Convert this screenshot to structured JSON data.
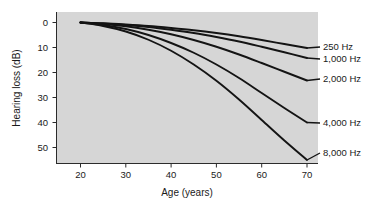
{
  "chart_data": {
    "type": "line",
    "title": "",
    "xlabel": "Age (years)",
    "ylabel": "Hearing loss (dB)",
    "x": [
      20,
      25,
      30,
      35,
      40,
      45,
      50,
      55,
      60,
      65,
      70
    ],
    "xlim": [
      18,
      72
    ],
    "ylim": [
      0,
      58
    ],
    "y_inverted": true,
    "xticks": [
      20,
      30,
      40,
      50,
      60,
      70
    ],
    "xticklabels": [
      "20",
      "30",
      "40",
      "50",
      "60",
      "70"
    ],
    "yticks": [
      0,
      10,
      20,
      30,
      40,
      50
    ],
    "yticklabels": [
      "0",
      "10",
      "20",
      "30",
      "40",
      "50"
    ],
    "grid": false,
    "legend_position": "right-inline-labels",
    "background_color": "#d6d6d6",
    "line_color": "#141414",
    "series": [
      {
        "name": "250 Hz",
        "label": "250 Hz",
        "values": [
          0,
          0.3,
          0.8,
          1.4,
          2.2,
          3.1,
          4.2,
          5.5,
          7.0,
          8.6,
          10.2
        ]
      },
      {
        "name": "1,000 Hz",
        "label": "1,000 Hz",
        "values": [
          0,
          0.4,
          1.0,
          1.8,
          2.9,
          4.2,
          5.8,
          7.6,
          9.7,
          11.9,
          14.2
        ]
      },
      {
        "name": "2,000 Hz",
        "label": "2,000 Hz",
        "values": [
          0,
          0.6,
          1.5,
          2.9,
          4.7,
          7.0,
          9.7,
          12.8,
          16.2,
          19.7,
          23.2
        ]
      },
      {
        "name": "4,000 Hz",
        "label": "4,000 Hz",
        "values": [
          0,
          1.0,
          2.6,
          5.0,
          8.2,
          12.1,
          16.8,
          22.2,
          28.2,
          34.2,
          40.0
        ]
      },
      {
        "name": "8,000 Hz",
        "label": "8,000 Hz",
        "values": [
          0,
          1.4,
          3.6,
          6.9,
          11.3,
          16.8,
          23.3,
          30.8,
          39.0,
          47.2,
          55.0
        ]
      }
    ]
  },
  "axes": {
    "x_title": "Age (years)",
    "y_title": "Hearing loss (dB)",
    "xticks": [
      "20",
      "30",
      "40",
      "50",
      "60",
      "70"
    ],
    "yticks": [
      "0",
      "10",
      "20",
      "30",
      "40",
      "50"
    ]
  },
  "series_labels": {
    "s0": "250 Hz",
    "s1": "1,000 Hz",
    "s2": "2,000 Hz",
    "s3": "4,000 Hz",
    "s4": "8,000 Hz"
  }
}
